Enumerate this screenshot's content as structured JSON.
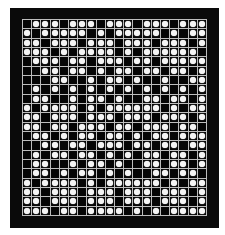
{
  "board": {
    "columns": 20,
    "rows": 21,
    "colors": {
      "frame": "#0a0a0a",
      "cell": "#050505",
      "grid_line": "#bdbdbd",
      "stone": "#f4f4f4"
    },
    "cells": [
      [
        0,
        1,
        1,
        1,
        0,
        1,
        1,
        1,
        0,
        1,
        1,
        1,
        0,
        1,
        1,
        1,
        0,
        1,
        1,
        1
      ],
      [
        1,
        0,
        1,
        1,
        1,
        1,
        1,
        0,
        1,
        0,
        1,
        1,
        1,
        1,
        1,
        0,
        1,
        0,
        1,
        1
      ],
      [
        1,
        1,
        0,
        1,
        1,
        1,
        0,
        1,
        1,
        1,
        0,
        1,
        1,
        1,
        0,
        1,
        1,
        1,
        0,
        1
      ],
      [
        1,
        1,
        1,
        0,
        1,
        0,
        1,
        1,
        1,
        1,
        0,
        1,
        0,
        1,
        1,
        1,
        1,
        1,
        1,
        0
      ],
      [
        0,
        1,
        1,
        1,
        0,
        1,
        1,
        0,
        1,
        1,
        1,
        0,
        1,
        1,
        0,
        1,
        1,
        1,
        1,
        1
      ],
      [
        0,
        0,
        1,
        1,
        0,
        1,
        1,
        0,
        1,
        0,
        1,
        1,
        0,
        1,
        1,
        0,
        1,
        1,
        0,
        1
      ],
      [
        0,
        0,
        0,
        1,
        1,
        0,
        0,
        1,
        0,
        1,
        1,
        0,
        1,
        0,
        0,
        1,
        0,
        0,
        1,
        1
      ],
      [
        0,
        1,
        0,
        1,
        0,
        1,
        0,
        1,
        0,
        1,
        0,
        1,
        0,
        1,
        0,
        1,
        0,
        1,
        0,
        1
      ],
      [
        0,
        1,
        1,
        0,
        0,
        1,
        0,
        1,
        1,
        0,
        1,
        0,
        0,
        1,
        1,
        0,
        1,
        1,
        0,
        1
      ],
      [
        1,
        0,
        1,
        1,
        1,
        1,
        0,
        1,
        0,
        1,
        1,
        1,
        1,
        1,
        1,
        0,
        1,
        0,
        1,
        1
      ],
      [
        1,
        1,
        0,
        1,
        1,
        1,
        0,
        1,
        1,
        1,
        0,
        1,
        1,
        1,
        0,
        1,
        1,
        1,
        0,
        1
      ],
      [
        1,
        1,
        0,
        1,
        1,
        0,
        1,
        1,
        1,
        0,
        1,
        1,
        0,
        1,
        1,
        1,
        0,
        1,
        1,
        0
      ],
      [
        0,
        1,
        1,
        0,
        1,
        0,
        1,
        1,
        0,
        1,
        1,
        0,
        1,
        0,
        1,
        1,
        0,
        1,
        1,
        1
      ],
      [
        0,
        0,
        1,
        1,
        0,
        1,
        1,
        0,
        1,
        1,
        1,
        0,
        1,
        1,
        0,
        1,
        1,
        0,
        1,
        1
      ],
      [
        0,
        1,
        0,
        1,
        1,
        0,
        1,
        1,
        0,
        1,
        0,
        1,
        0,
        1,
        1,
        0,
        1,
        1,
        0,
        1
      ],
      [
        0,
        1,
        1,
        0,
        0,
        1,
        0,
        1,
        1,
        0,
        1,
        0,
        0,
        1,
        1,
        0,
        1,
        1,
        0,
        1
      ],
      [
        0,
        1,
        1,
        0,
        1,
        0,
        1,
        1,
        0,
        1,
        0,
        1,
        0,
        0,
        1,
        1,
        0,
        1,
        1,
        0
      ],
      [
        1,
        0,
        1,
        1,
        1,
        1,
        0,
        1,
        0,
        1,
        1,
        1,
        1,
        1,
        1,
        0,
        1,
        0,
        1,
        1
      ],
      [
        1,
        1,
        0,
        1,
        1,
        1,
        0,
        1,
        1,
        1,
        0,
        1,
        1,
        1,
        0,
        1,
        1,
        1,
        0,
        1
      ],
      [
        1,
        1,
        0,
        1,
        1,
        1,
        0,
        1,
        1,
        1,
        0,
        1,
        1,
        1,
        0,
        1,
        1,
        1,
        0,
        1
      ],
      [
        1,
        1,
        1,
        0,
        1,
        1,
        0,
        1,
        1,
        1,
        1,
        0,
        1,
        0,
        1,
        0,
        1,
        1,
        1,
        1
      ]
    ]
  }
}
